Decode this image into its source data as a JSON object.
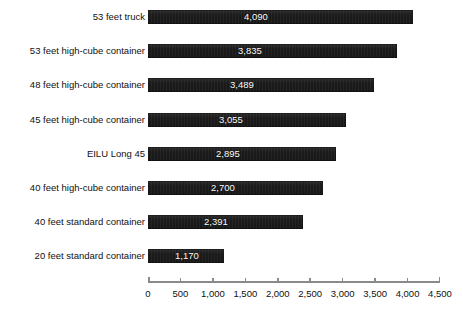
{
  "chart_data": {
    "type": "bar",
    "orientation": "horizontal",
    "title": "",
    "subtitle": "",
    "xlabel": "",
    "ylabel": "",
    "xlim": [
      0,
      4500
    ],
    "grid": false,
    "legend": null,
    "axis_tick_step": 500,
    "xticks": [
      0,
      500,
      1000,
      1500,
      2000,
      2500,
      3000,
      3500,
      4000,
      4500
    ],
    "xtick_labels": [
      "0",
      "500",
      "1,000",
      "1,500",
      "2,000",
      "2,500",
      "3,000",
      "3,500",
      "4,000",
      "4,500"
    ],
    "categories": [
      "53 feet truck",
      "53 feet high-cube container",
      "48 feet high-cube container",
      "45 feet high-cube container",
      "EILU Long 45",
      "40 feet high-cube container",
      "40 feet standard container",
      "20 feet standard container"
    ],
    "values": [
      4090,
      3835,
      3489,
      3055,
      2895,
      2700,
      2391,
      1170
    ],
    "value_labels": [
      "4,090",
      "3,835",
      "3,489",
      "3,055",
      "2,895",
      "2,700",
      "2,391",
      "1,170"
    ],
    "bar_color": "#1b1b1b",
    "value_label_color": "#ffffff",
    "axis_color": "#8a8a8a",
    "text_color": "#111111",
    "background_color": "#ffffff"
  },
  "rows": [
    {
      "label": "53 feet truck",
      "value": 4090,
      "value_label": "4,090"
    },
    {
      "label": "53 feet high-cube container",
      "value": 3835,
      "value_label": "3,835"
    },
    {
      "label": "48 feet high-cube container",
      "value": 3489,
      "value_label": "3,489"
    },
    {
      "label": "45 feet high-cube container",
      "value": 3055,
      "value_label": "3,055"
    },
    {
      "label": "EILU Long 45",
      "value": 2895,
      "value_label": "2,895"
    },
    {
      "label": "40 feet high-cube container",
      "value": 2700,
      "value_label": "2,700"
    },
    {
      "label": "40 feet standard container",
      "value": 2391,
      "value_label": "2,391"
    },
    {
      "label": "20 feet standard container",
      "value": 1170,
      "value_label": "1,170"
    }
  ],
  "axis": {
    "ticks": [
      "0",
      "500",
      "1,000",
      "1,500",
      "2,000",
      "2,500",
      "3,000",
      "3,500",
      "4,000",
      "4,500"
    ]
  }
}
